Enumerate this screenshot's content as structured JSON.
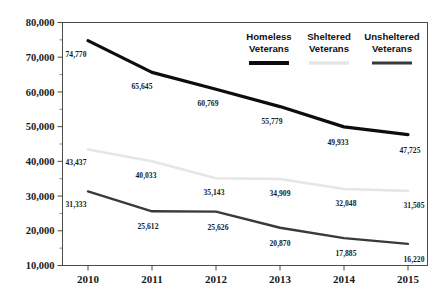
{
  "chart_data": {
    "type": "line",
    "title": "",
    "xlabel": "",
    "ylabel": "",
    "categories": [
      "2010",
      "2011",
      "2012",
      "2013",
      "2014",
      "2015"
    ],
    "ylim": [
      10000,
      80000
    ],
    "ytick_labels": [
      "10,000",
      "20,000",
      "30,000",
      "40,000",
      "50,000",
      "60,000",
      "70,000",
      "80,000"
    ],
    "ytick_values": [
      10000,
      20000,
      30000,
      40000,
      50000,
      60000,
      70000,
      80000
    ],
    "ytick_minor_values": [
      15000,
      25000,
      35000,
      45000,
      55000,
      65000,
      75000
    ],
    "grid": false,
    "legend_position": "top-right",
    "series": [
      {
        "name": "Homeless Veterans",
        "color": "#0d0d0d",
        "line_width": 3.2,
        "values": [
          74770,
          65645,
          60769,
          55779,
          49933,
          47725
        ],
        "labels": [
          "74,770",
          "65,645",
          "60,769",
          "55,779",
          "49,933",
          "47,725"
        ]
      },
      {
        "name": "Sheltered Veterans",
        "color": "#e6e6e6",
        "line_width": 2.6,
        "values": [
          43437,
          40033,
          35143,
          34909,
          32048,
          31505
        ],
        "labels": [
          "43,437",
          "40,033",
          "35,143",
          "34,909",
          "32,048",
          "31,505"
        ]
      },
      {
        "name": "Unsheltered Veterans",
        "color": "#3a3a3a",
        "line_width": 2.4,
        "values": [
          31333,
          25612,
          25526,
          20870,
          17885,
          16220
        ],
        "labels": [
          "31,333",
          "25,612",
          "25,626",
          "20,870",
          "17,885",
          "16,220"
        ]
      }
    ]
  },
  "legend": {
    "entries": [
      {
        "line1": "Homeless",
        "line2": "Veterans",
        "color": "#0d0d0d"
      },
      {
        "line1": "Sheltered",
        "line2": "Veterans",
        "color": "#e6e6e6"
      },
      {
        "line1": "Unsheltered",
        "line2": "Veterans",
        "color": "#3a3a3a"
      }
    ]
  }
}
